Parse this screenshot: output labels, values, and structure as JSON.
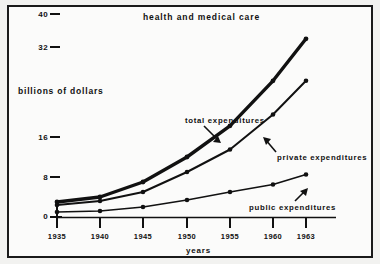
{
  "figure": {
    "title": "health and medical care",
    "x_axis_label": "years",
    "y_axis_label": "billions of dollars"
  },
  "annotations": {
    "total": "total expenditures",
    "private": "private expenditures",
    "public": "public expenditures"
  },
  "axis": {
    "y_ticks": [
      "40",
      "32",
      "16",
      "8",
      "0"
    ],
    "x_ticks": [
      "1935",
      "1940",
      "1945",
      "1950",
      "1955",
      "1960",
      "1963"
    ]
  },
  "chart_data": {
    "type": "line",
    "title": "health and medical care",
    "xlabel": "years",
    "ylabel": "billions of dollars",
    "categories": [
      "1935",
      "1940",
      "1945",
      "1950",
      "1955",
      "1960",
      "1963"
    ],
    "x": [
      1935,
      1940,
      1945,
      1950,
      1955,
      1960,
      1963
    ],
    "y_tick_values": [
      0,
      8,
      16,
      32,
      40
    ],
    "ylim": [
      0,
      40
    ],
    "grid": false,
    "legend": "inline-annotations",
    "series": [
      {
        "name": "total expenditures",
        "values": [
          3.0,
          4.0,
          7.0,
          12.0,
          18.0,
          26.0,
          34.0
        ]
      },
      {
        "name": "private expenditures",
        "values": [
          2.4,
          3.2,
          5.0,
          9.0,
          13.5,
          20.0,
          26.0
        ]
      },
      {
        "name": "public expenditures",
        "values": [
          1.0,
          1.2,
          2.0,
          3.4,
          5.0,
          6.5,
          8.5
        ]
      }
    ]
  },
  "colors": {
    "ink": "#111111",
    "paper": "#fbfbfa"
  }
}
